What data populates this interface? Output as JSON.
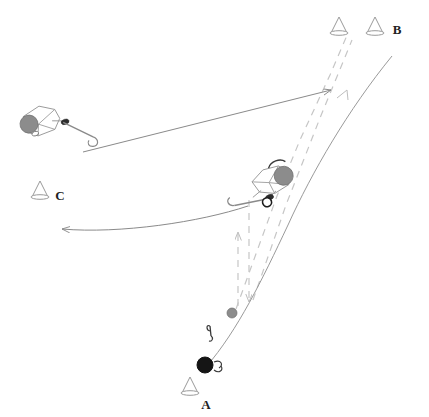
{
  "diagram": {
    "background_color": "#ffffff",
    "colors": {
      "line": "#8a8a8a",
      "dashed": "#c2c2c2",
      "player_outline": "#8f8f8f",
      "helmet_gray": "#8c8c8c",
      "puck_black": "#151515",
      "puck_gray": "#8c8c8c",
      "cone_outline": "#9a9a9a",
      "label_text": "#222222"
    },
    "labels": [
      {
        "name": "label-a",
        "text": "A",
        "x": 206,
        "y": 409
      },
      {
        "name": "label-b",
        "text": "B",
        "x": 395,
        "y": 34
      },
      {
        "name": "label-c",
        "text": "C",
        "x": 58,
        "y": 200
      }
    ],
    "cones": [
      {
        "name": "cone-a",
        "x": 190,
        "y": 392,
        "label": "A"
      },
      {
        "name": "cone-b1",
        "x": 339,
        "y": 32,
        "label": ""
      },
      {
        "name": "cone-b2",
        "x": 375,
        "y": 32,
        "label": "B"
      },
      {
        "name": "cone-c",
        "x": 40,
        "y": 196,
        "label": "C"
      }
    ],
    "players": [
      {
        "name": "player-passer",
        "x": 42,
        "y": 122,
        "rotation": -18,
        "helmet": "gray"
      },
      {
        "name": "player-shooter",
        "x": 268,
        "y": 184,
        "rotation": -20,
        "helmet": "gray"
      }
    ],
    "pucks": [
      {
        "name": "puck-black-start",
        "x": 205,
        "y": 365,
        "radius": 8,
        "color": "black"
      },
      {
        "name": "puck-gray-mid",
        "x": 232,
        "y": 313,
        "radius": 5,
        "color": "gray"
      }
    ],
    "arrows": [
      {
        "name": "pass-arrow-straight",
        "style": "solid",
        "from": "player-passer",
        "to": "cone-b-area"
      },
      {
        "name": "skate-path-curve",
        "style": "solid",
        "from": "player-shooter",
        "to": "cone-b2"
      },
      {
        "name": "return-pass-curve",
        "style": "solid",
        "from": "player-shooter",
        "to": "cone-c"
      },
      {
        "name": "puck-travel-dashed-up",
        "style": "dashed",
        "direction": "up"
      },
      {
        "name": "puck-travel-dashed-down",
        "style": "dashed",
        "direction": "down"
      },
      {
        "name": "puck-travel-dashed-diagonal",
        "style": "dashed",
        "direction": "up-right"
      }
    ],
    "legend_note": ""
  }
}
